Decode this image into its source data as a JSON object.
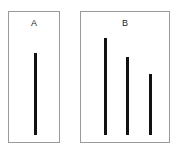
{
  "figure": {
    "background_color": "#ffffff",
    "border_color": "#9a9a9a",
    "bar_color": "#111111",
    "label_color": "#262626"
  },
  "chart_data": {
    "type": "bar",
    "title": "",
    "xlabel": "",
    "ylabel": "",
    "grid": false,
    "legend_position": "none",
    "panels": [
      {
        "label": "A",
        "categories": [
          "bar-1"
        ],
        "values": [
          82
        ],
        "ylim": [
          0,
          132
        ],
        "bar_count": 1
      },
      {
        "label": "B",
        "categories": [
          "bar-1",
          "bar-2",
          "bar-3"
        ],
        "values": [
          97,
          78,
          61
        ],
        "ylim": [
          0,
          132
        ],
        "bar_count": 3
      }
    ],
    "units": "px",
    "note": "Two bordered panels; panel A holds a single vertical bar, panel B holds three vertical bars of decreasing height."
  },
  "panel_a": {
    "label": "A",
    "geometry": {
      "left": 8,
      "top": 11,
      "width": 52,
      "height": 132
    },
    "bars": [
      {
        "name": "bar-a-1",
        "left": 25,
        "width": 3,
        "height": 82
      }
    ]
  },
  "panel_b": {
    "label": "B",
    "geometry": {
      "left": 80,
      "top": 11,
      "width": 90,
      "height": 132
    },
    "bars": [
      {
        "name": "bar-b-1",
        "left": 23,
        "width": 3,
        "height": 97
      },
      {
        "name": "bar-b-2",
        "left": 45,
        "width": 3,
        "height": 78
      },
      {
        "name": "bar-b-3",
        "left": 68,
        "width": 3,
        "height": 61
      }
    ]
  }
}
